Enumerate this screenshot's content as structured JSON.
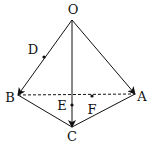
{
  "diagram": {
    "type": "tetrahedron-vectors",
    "points": {
      "O": {
        "label": "O",
        "x": 72,
        "y": 20,
        "lx": 73,
        "ly": 14
      },
      "A": {
        "label": "A",
        "x": 135,
        "y": 94,
        "lx": 142,
        "ly": 101
      },
      "B": {
        "label": "B",
        "x": 18,
        "y": 95,
        "lx": 10,
        "ly": 102
      },
      "C": {
        "label": "C",
        "x": 72,
        "y": 127,
        "lx": 72,
        "ly": 141
      },
      "D": {
        "label": "D",
        "x": 44,
        "y": 57,
        "lx": 33,
        "ly": 54
      },
      "E": {
        "label": "E",
        "x": 72,
        "y": 105,
        "lx": 62,
        "ly": 110
      },
      "F": {
        "label": "F",
        "x": 92,
        "y": 96,
        "lx": 92,
        "ly": 114
      }
    },
    "edges": [
      {
        "from": "O",
        "to": "A",
        "style": "solid",
        "arrow": true
      },
      {
        "from": "O",
        "to": "B",
        "style": "solid",
        "arrow": true
      },
      {
        "from": "O",
        "to": "C",
        "style": "solid",
        "arrow": true
      },
      {
        "from": "B",
        "to": "C",
        "style": "solid",
        "arrow": false
      },
      {
        "from": "C",
        "to": "A",
        "style": "solid",
        "arrow": false
      },
      {
        "from": "B",
        "to": "A",
        "style": "dashed",
        "arrow": false
      }
    ],
    "dots": [
      "D",
      "E",
      "F"
    ],
    "colors": {
      "stroke": "#111111",
      "background": "#ffffff"
    }
  }
}
